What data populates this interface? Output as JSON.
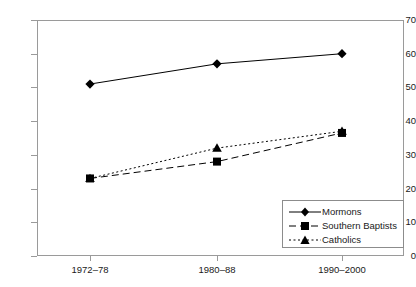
{
  "chart_data": {
    "type": "line",
    "title": "",
    "xlabel": "",
    "ylabel": "",
    "categories": [
      "1972–78",
      "1980–88",
      "1990–2000"
    ],
    "ylim": [
      0,
      70
    ],
    "yticks": [
      0,
      10,
      20,
      30,
      40,
      50,
      60,
      70
    ],
    "grid": false,
    "legend_position": "bottom-right",
    "series": [
      {
        "name": "Mormons",
        "values": [
          51,
          57,
          60
        ],
        "marker": "diamond",
        "line_style": "solid",
        "color": "#000000"
      },
      {
        "name": "Southern Baptists",
        "values": [
          23,
          28,
          36.5
        ],
        "marker": "square",
        "line_style": "dashed",
        "color": "#000000"
      },
      {
        "name": "Catholics",
        "values": [
          23,
          32,
          37
        ],
        "marker": "triangle",
        "line_style": "dotted",
        "color": "#000000"
      }
    ]
  },
  "legend": {
    "items": [
      {
        "label": "Mormons"
      },
      {
        "label": "Southern Baptists"
      },
      {
        "label": "Catholics"
      }
    ]
  },
  "axes": {
    "y_tick_labels": [
      "70",
      "60",
      "50",
      "40",
      "30",
      "20",
      "10",
      "0"
    ],
    "x_tick_labels": [
      "1972–78",
      "1980–88",
      "1990–2000"
    ]
  },
  "colors": {
    "ink": "#000000",
    "frame": "#9a9a9a",
    "background": "#ffffff"
  }
}
